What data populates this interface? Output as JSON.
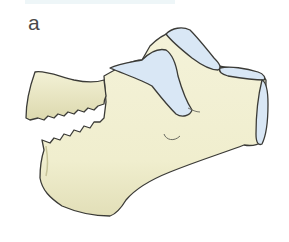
{
  "figure": {
    "panel_label": "a",
    "colors": {
      "bone_fill": "#f1efd2",
      "bone_shadow": "#d9d6ad",
      "articular_fill": "#d9e7f5",
      "outline": "#3b3b37",
      "background": "#ffffff"
    }
  }
}
